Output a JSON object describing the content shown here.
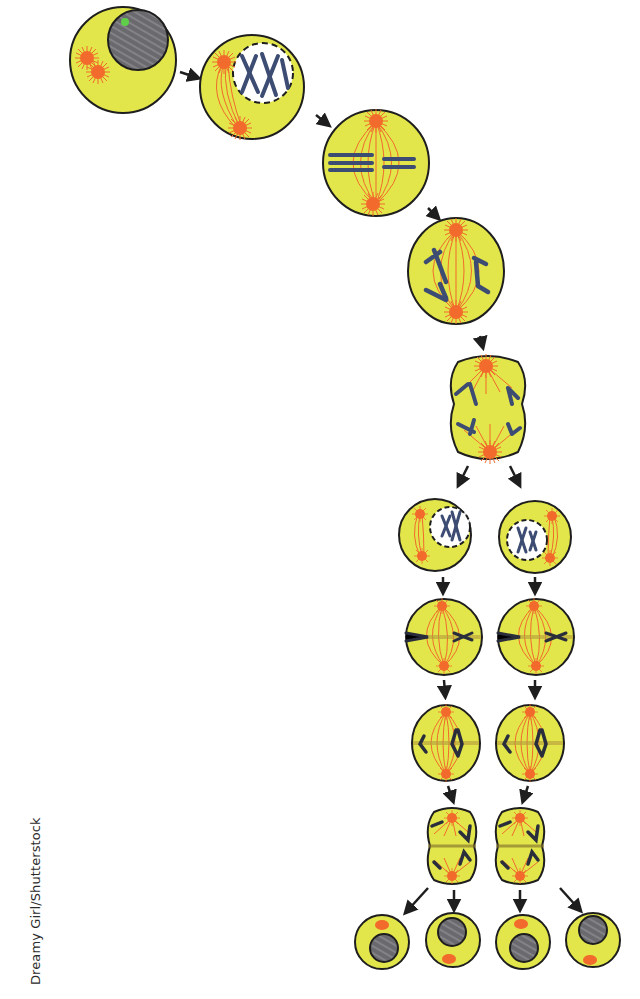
{
  "diagram": {
    "credit": "Dreamy Girl/Shutterstock",
    "colors": {
      "cytoplasm": "#e2e64a",
      "cell_outline": "#1e1e1e",
      "spindle": "#f0682a",
      "chromosome": "#3d4c72",
      "nucleus": "#6e6e72",
      "nucleolus": "#5fcf4a",
      "arrow": "#1e1e1e",
      "background": "#ffffff"
    },
    "stages": [
      {
        "id": "interphase",
        "cells": 1
      },
      {
        "id": "prophase-1",
        "cells": 1
      },
      {
        "id": "metaphase-1",
        "cells": 1
      },
      {
        "id": "anaphase-1",
        "cells": 1
      },
      {
        "id": "telophase-1",
        "cells": 1
      },
      {
        "id": "prophase-2",
        "cells": 2
      },
      {
        "id": "metaphase-2",
        "cells": 2
      },
      {
        "id": "anaphase-2",
        "cells": 2
      },
      {
        "id": "telophase-2",
        "cells": 2
      },
      {
        "id": "daughter-cells",
        "cells": 4
      }
    ]
  }
}
